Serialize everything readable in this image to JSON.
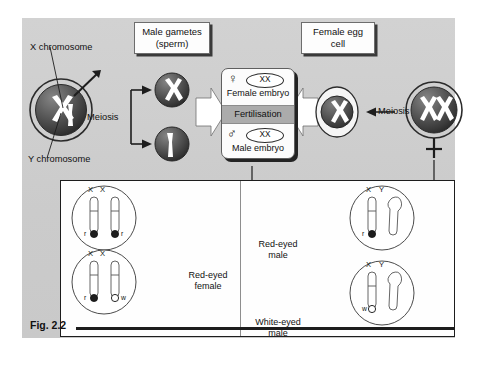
{
  "figure": {
    "id": "Fig. 2.2",
    "caption_tag": "Fig. 2.2",
    "topic": "Sex determination and sex-linked eye colour inheritance in fruit flies"
  },
  "labels": {
    "x_chromosome": "X chromosome",
    "y_chromosome": "Y chromosome",
    "male_gametes": "Male gametes",
    "male_gametes_sub": "(sperm)",
    "female_egg": "Female egg",
    "female_egg_sub": "cell",
    "meiosis_left": "Meiosis",
    "meiosis_right": "Meiosis"
  },
  "fertilisation": {
    "title": "Fertilisation",
    "female_symbol": "♀",
    "male_symbol": "♂",
    "female_genotype": "XX",
    "male_genotype": "XX",
    "female_caption": "Female embryo",
    "male_caption": "Male embryo"
  },
  "parents": {
    "male_cell": {
      "chromosomes": [
        "X",
        "Y"
      ]
    },
    "female_cell": {
      "chromosomes": [
        "X",
        "X"
      ],
      "symbol": "♀"
    }
  },
  "gametes": {
    "sperm": [
      {
        "chromosome": "X"
      },
      {
        "chromosome": "Y"
      }
    ],
    "egg": [
      {
        "chromosome": "X"
      }
    ]
  },
  "crosses": {
    "female_panel": [
      {
        "chromosome_labels": [
          "X",
          "X"
        ],
        "alleles": [
          {
            "label": "r",
            "side": "left",
            "fill": "filled"
          },
          {
            "label": "r",
            "side": "right",
            "fill": "filled"
          }
        ]
      },
      {
        "chromosome_labels": [
          "X",
          "X"
        ],
        "alleles": [
          {
            "label": "r",
            "side": "left",
            "fill": "filled"
          },
          {
            "label": "w",
            "side": "right",
            "fill": "open"
          }
        ]
      }
    ],
    "female_result": {
      "line1": "Red-eyed",
      "line2": "female",
      "eye": "red"
    },
    "male_panel": [
      {
        "chromosome_labels": [
          "X",
          "Y"
        ],
        "alleles": [
          {
            "label": "r",
            "side": "left",
            "fill": "filled"
          }
        ],
        "result": {
          "line1": "Red-eyed",
          "line2": "male",
          "eye": "red"
        }
      },
      {
        "chromosome_labels": [
          "X",
          "Y"
        ],
        "alleles": [
          {
            "label": "w",
            "side": "left",
            "fill": "open"
          }
        ],
        "result": {
          "line1": "White-eyed",
          "line2": "male",
          "eye": "white"
        }
      }
    ]
  },
  "colors": {
    "panel_background": "#cecece",
    "inner_panel": "#fefefe",
    "cell_fill": "#4b4b4b",
    "chromosome": "#ffffff",
    "fertilisation_bar": "#ababab",
    "outline": "#1d1d1d"
  }
}
